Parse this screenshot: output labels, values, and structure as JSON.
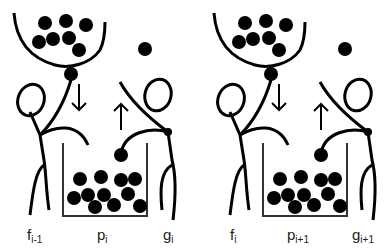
{
  "diagram": {
    "type": "illustration",
    "colors": {
      "ink": "#000000",
      "background": "#ffffff",
      "label": "#222222"
    },
    "panels": [
      {
        "labels": {
          "left_base": "f",
          "left_sub": "i-1",
          "mid_base": "p",
          "mid_sub": "i",
          "right_base": "g",
          "right_sub": "i"
        },
        "arrows": [
          "down",
          "up"
        ],
        "bowl_balls": 8,
        "bin_balls": 13
      },
      {
        "labels": {
          "left_base": "f",
          "left_sub": "i",
          "mid_base": "p",
          "mid_sub": "i+1",
          "right_base": "g",
          "right_sub": "i+1"
        },
        "arrows": [
          "down",
          "up"
        ],
        "bowl_balls": 8,
        "bin_balls": 13
      }
    ]
  }
}
